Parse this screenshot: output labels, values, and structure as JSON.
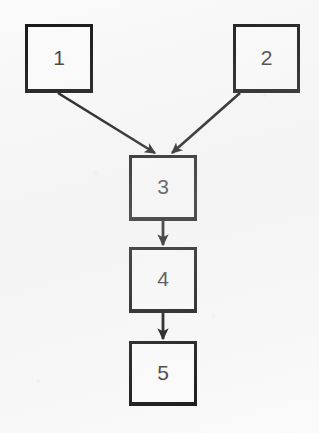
{
  "diagram": {
    "type": "flowchart",
    "background_color": "#fafafa",
    "stroke_color": "#111111",
    "label_color": "#3b3b3b",
    "nodes": [
      {
        "id": "1",
        "label": "1",
        "shape": "rectangle",
        "x": 25,
        "y": 24,
        "width": 68,
        "height": 69
      },
      {
        "id": "2",
        "label": "2",
        "shape": "rectangle",
        "x": 233,
        "y": 24,
        "width": 67,
        "height": 69
      },
      {
        "id": "3",
        "label": "3",
        "shape": "rectangle",
        "x": 129,
        "y": 155,
        "width": 68,
        "height": 66
      },
      {
        "id": "4",
        "label": "4",
        "shape": "rectangle",
        "x": 129,
        "y": 247,
        "width": 68,
        "height": 66
      },
      {
        "id": "5",
        "label": "5",
        "shape": "rectangle",
        "x": 129,
        "y": 341,
        "width": 68,
        "height": 65
      }
    ],
    "edges": [
      {
        "from": "1",
        "to": "3",
        "style": "solid",
        "arrowhead": "filled-triangle",
        "direction": "diagonal-down-right"
      },
      {
        "from": "2",
        "to": "3",
        "style": "solid",
        "arrowhead": "filled-triangle",
        "direction": "diagonal-down-left"
      },
      {
        "from": "3",
        "to": "4",
        "style": "solid",
        "arrowhead": "filled-triangle",
        "direction": "vertical-down"
      },
      {
        "from": "4",
        "to": "5",
        "style": "solid",
        "arrowhead": "filled-triangle",
        "direction": "vertical-down"
      }
    ]
  }
}
